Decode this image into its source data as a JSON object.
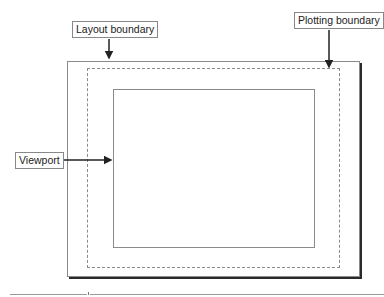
{
  "diagram": {
    "labels": {
      "layout_boundary": "Layout boundary",
      "plotting_boundary": "Plotting boundary",
      "viewport": "Viewport"
    },
    "regions": [
      {
        "name": "layout-boundary",
        "style": "solid with drop shadow"
      },
      {
        "name": "plotting-boundary",
        "style": "dashed"
      },
      {
        "name": "viewport",
        "style": "solid"
      }
    ],
    "colors": {
      "border": "#8a8a8a",
      "arrow": "#222222",
      "shadow": "#2a2a2a",
      "background": "#ffffff"
    },
    "footer": {
      "page_marker": "8"
    }
  }
}
